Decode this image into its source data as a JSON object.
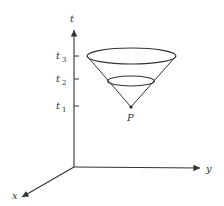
{
  "diagram": {
    "type": "light cone in spacetime",
    "axes": {
      "t": {
        "label": "t"
      },
      "y": {
        "label": "y"
      },
      "x": {
        "label": "x"
      }
    },
    "ticks": [
      {
        "base": "t",
        "sub": "3"
      },
      {
        "base": "t",
        "sub": "2"
      },
      {
        "base": "t",
        "sub": "1"
      }
    ],
    "apex_label": "P",
    "colors": {
      "line": "#333333",
      "background": "#ffffff"
    }
  }
}
